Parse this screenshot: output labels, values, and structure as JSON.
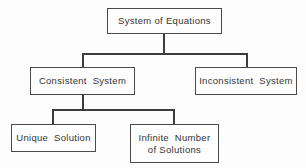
{
  "diagram": {
    "type": "tree-diagram",
    "background_color": "#fdfdfd",
    "line_color": "#3c3c3c",
    "box_border_color": "#4a4a4a",
    "text_color": "#333333",
    "nodes": [
      {
        "id": "root",
        "label": "System of Equations",
        "level": 0
      },
      {
        "id": "consistent",
        "label": "Consistent  System",
        "level": 1
      },
      {
        "id": "inconsistent",
        "label": "Inconsistent  System",
        "level": 1
      },
      {
        "id": "unique",
        "label": "Unique  Solution",
        "level": 2
      },
      {
        "id": "infinite",
        "label": "Infinite  Number\nof Solutions",
        "level": 2
      }
    ],
    "edges": [
      {
        "from": "root",
        "to": "consistent"
      },
      {
        "from": "root",
        "to": "inconsistent"
      },
      {
        "from": "consistent",
        "to": "unique"
      },
      {
        "from": "consistent",
        "to": "infinite"
      }
    ]
  }
}
